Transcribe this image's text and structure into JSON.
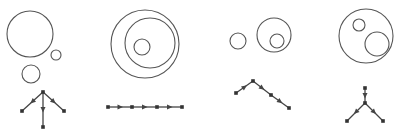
{
  "figure": {
    "colors": {
      "stroke": "#555555",
      "node": "#333333",
      "background": "#ffffff"
    },
    "panels": [
      {
        "name": "panel-1",
        "circles": [
          {
            "cx": 30,
            "cy": 34,
            "r": 23
          },
          {
            "cx": 56,
            "cy": 55,
            "r": 5
          },
          {
            "cx": 31,
            "cy": 74,
            "r": 9
          }
        ],
        "nodes": [
          [
            43,
            92
          ],
          [
            22,
            111
          ],
          [
            64,
            111
          ],
          [
            43,
            127
          ]
        ],
        "edges": [
          [
            0,
            1
          ],
          [
            0,
            2
          ],
          [
            0,
            3
          ]
        ]
      },
      {
        "name": "panel-2",
        "circles": [
          {
            "cx": 145,
            "cy": 44,
            "r": 34
          },
          {
            "cx": 150,
            "cy": 43,
            "r": 25
          },
          {
            "cx": 142,
            "cy": 47,
            "r": 8
          }
        ],
        "nodes": [
          [
            108,
            107
          ],
          [
            132,
            107
          ],
          [
            157,
            107
          ],
          [
            182,
            107
          ]
        ],
        "edges": [
          [
            0,
            1
          ],
          [
            1,
            2
          ],
          [
            2,
            3
          ]
        ]
      },
      {
        "name": "panel-3",
        "circles": [
          {
            "cx": 238,
            "cy": 41,
            "r": 8
          },
          {
            "cx": 274,
            "cy": 35,
            "r": 17
          },
          {
            "cx": 277,
            "cy": 41,
            "r": 7
          }
        ],
        "nodes": [
          [
            236,
            93
          ],
          [
            253,
            81
          ],
          [
            271,
            95
          ],
          [
            289,
            108
          ]
        ],
        "edges": [
          [
            0,
            1
          ],
          [
            1,
            2
          ],
          [
            2,
            3
          ]
        ]
      },
      {
        "name": "panel-4",
        "circles": [
          {
            "cx": 366,
            "cy": 36,
            "r": 27
          },
          {
            "cx": 359,
            "cy": 25,
            "r": 6
          },
          {
            "cx": 377,
            "cy": 44,
            "r": 12
          }
        ],
        "nodes": [
          [
            365,
            88
          ],
          [
            365,
            103
          ],
          [
            347,
            121
          ],
          [
            383,
            121
          ]
        ],
        "edges": [
          [
            0,
            1
          ],
          [
            1,
            2
          ],
          [
            1,
            3
          ]
        ]
      }
    ]
  }
}
